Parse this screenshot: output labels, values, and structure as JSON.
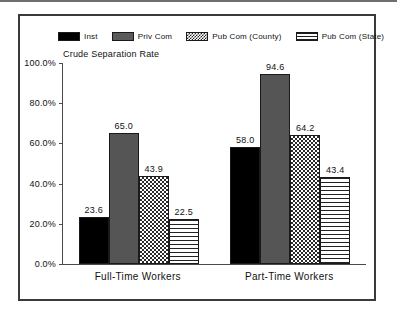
{
  "chart_data": {
    "type": "bar",
    "title": "",
    "ylabel": "Crude Separation Rate",
    "xlabel": "",
    "categories": [
      "Full-Time Workers",
      "Part-Time Workers"
    ],
    "series": [
      {
        "name": "Inst",
        "values": [
          23.6,
          65.0
        ],
        "pattern": "solid-black",
        "color": "#000000"
      },
      {
        "name": "Priv Com",
        "values": [
          65.0,
          94.6
        ],
        "pattern": "solid-gray",
        "color": "#555555"
      },
      {
        "name": "Pub Com (County)",
        "values": [
          43.9,
          64.2
        ],
        "pattern": "checker",
        "color": "#2b2b2b"
      },
      {
        "name": "Pub Com (State)",
        "values": [
          22.5,
          43.4
        ],
        "pattern": "horizontal-stripe",
        "color": "#222222"
      }
    ],
    "data_by_group": [
      {
        "category": "Full-Time Workers",
        "values": [
          23.6,
          65.0,
          43.9,
          22.5
        ]
      },
      {
        "category": "Part-Time Workers",
        "values": [
          58.0,
          94.6,
          64.2,
          43.4
        ]
      }
    ],
    "ylim": [
      0,
      100
    ],
    "ytick_values": [
      0,
      20,
      40,
      60,
      80,
      100
    ],
    "ytick_labels": [
      "0.0%",
      "20.0%",
      "40.0%",
      "60.0%",
      "80.0%",
      "100.0%"
    ],
    "grid": false,
    "legend_position": "top"
  },
  "legend": {
    "items": [
      {
        "label": "Inst"
      },
      {
        "label": "Priv Com"
      },
      {
        "label": "Pub Com (County)"
      },
      {
        "label": "Pub Com (State)"
      }
    ]
  },
  "axis": {
    "y_title": "Crude Separation Rate",
    "ticks": [
      {
        "label": "100.0%"
      },
      {
        "label": "80.0%"
      },
      {
        "label": "60.0%"
      },
      {
        "label": "40.0%"
      },
      {
        "label": "20.0%"
      },
      {
        "label": "0.0%"
      }
    ]
  },
  "groups": [
    {
      "label": "Full-Time Workers",
      "bars": [
        {
          "series": "Inst",
          "value": 23.6,
          "value_label": "23.6"
        },
        {
          "series": "Priv Com",
          "value": 65.0,
          "value_label": "65.0"
        },
        {
          "series": "Pub Com (County)",
          "value": 43.9,
          "value_label": "43.9"
        },
        {
          "series": "Pub Com (State)",
          "value": 22.5,
          "value_label": "22.5"
        }
      ]
    },
    {
      "label": "Part-Time Workers",
      "bars": [
        {
          "series": "Inst",
          "value": 58.0,
          "value_label": "58.0"
        },
        {
          "series": "Priv Com",
          "value": 94.6,
          "value_label": "94.6"
        },
        {
          "series": "Pub Com (County)",
          "value": 64.2,
          "value_label": "64.2"
        },
        {
          "series": "Pub Com (State)",
          "value": 43.4,
          "value_label": "43.4"
        }
      ]
    }
  ]
}
